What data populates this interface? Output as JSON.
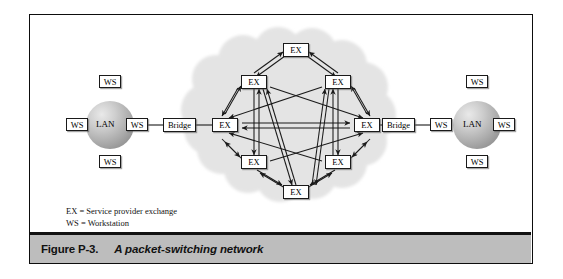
{
  "figure": {
    "caption_number": "Figure P-3.",
    "caption_title": "A packet-switching network"
  },
  "legend": {
    "line1": "EX = Service provider exchange",
    "line2": "WS = Workstation"
  },
  "labels": {
    "ws": "WS",
    "lan": "LAN",
    "bridge": "Bridge",
    "ex": "EX"
  },
  "left_lan": {
    "center_label": "LAN",
    "workstations": [
      {
        "position": "top",
        "label": "WS"
      },
      {
        "position": "left",
        "label": "WS"
      },
      {
        "position": "right",
        "label": "WS"
      },
      {
        "position": "bottom",
        "label": "WS"
      }
    ],
    "bridge_label": "Bridge"
  },
  "right_lan": {
    "center_label": "LAN",
    "workstations": [
      {
        "position": "top",
        "label": "WS"
      },
      {
        "position": "left",
        "label": "WS"
      },
      {
        "position": "right",
        "label": "WS"
      },
      {
        "position": "bottom",
        "label": "WS"
      }
    ],
    "bridge_label": "Bridge"
  },
  "cloud": {
    "node_label": "EX",
    "nodes": [
      {
        "id": "top",
        "label": "EX"
      },
      {
        "id": "upper-left",
        "label": "EX"
      },
      {
        "id": "upper-right",
        "label": "EX"
      },
      {
        "id": "left",
        "label": "EX"
      },
      {
        "id": "right",
        "label": "EX"
      },
      {
        "id": "lower-left",
        "label": "EX"
      },
      {
        "id": "lower-right",
        "label": "EX"
      },
      {
        "id": "bottom",
        "label": "EX"
      }
    ]
  },
  "colors": {
    "frame_border": "#0d0d0d",
    "caption_bar": "#bdbdbd",
    "cloud_fill": "#e3e3e3",
    "line": "#1a1a1a",
    "box_fill": "#ffffff",
    "sphere_mid": "#a9a9a9"
  }
}
